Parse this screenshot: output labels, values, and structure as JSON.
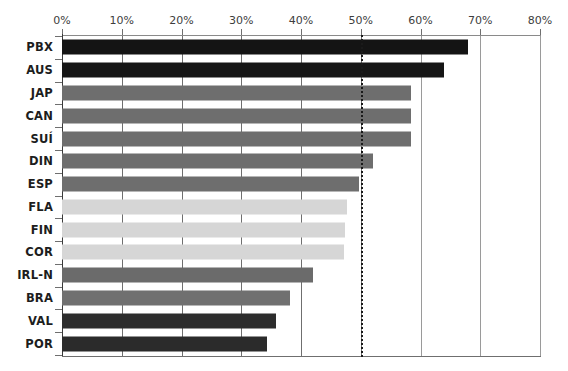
{
  "chart_data": {
    "type": "bar",
    "orientation": "horizontal",
    "title": "",
    "subtitle": "",
    "xlabel": "",
    "ylabel": "",
    "xlim": [
      0,
      80
    ],
    "xtick_values": [
      0,
      10,
      20,
      30,
      40,
      50,
      60,
      70,
      80
    ],
    "xtick_labels": [
      "0%",
      "10%",
      "20%",
      "30%",
      "40%",
      "50%",
      "60%",
      "70%",
      "80%"
    ],
    "xaxis_position": "top",
    "grid": "vertical",
    "legend": "none",
    "reference_line": {
      "value": 50,
      "label": "50%",
      "style": "dotted",
      "color": "#1a1a1a"
    },
    "categories": [
      "PBX",
      "AUS",
      "JAP",
      "CAN",
      "SUÍ",
      "DIN",
      "ESP",
      "FLA",
      "FIN",
      "COR",
      "IRL-N",
      "BRA",
      "VAL",
      "POR"
    ],
    "values": [
      68.0,
      64.0,
      58.4,
      58.4,
      58.4,
      52.0,
      49.7,
      47.7,
      47.4,
      47.2,
      42.0,
      38.2,
      35.8,
      34.3
    ],
    "bar_colors": [
      "#141414",
      "#161616",
      "#6e6e6e",
      "#6e6e6e",
      "#6e6e6e",
      "#6e6e6e",
      "#6e6e6e",
      "#d6d6d6",
      "#d6d6d6",
      "#d6d6d6",
      "#6b6b6b",
      "#707070",
      "#2d2d2d",
      "#2b2b2b"
    ],
    "series": [
      {
        "name": "percentage",
        "values": [
          68.0,
          64.0,
          58.4,
          58.4,
          58.4,
          52.0,
          49.7,
          47.7,
          47.4,
          47.2,
          42.0,
          38.2,
          35.8,
          34.3
        ]
      }
    ]
  },
  "colors": {
    "background": "#ffffff",
    "axis": "#6f6f6f",
    "gridline": "#6f6f6f",
    "text": "#1d1d1d",
    "tick_text": "#3d3d3d",
    "bar_dark": "#141414",
    "bar_dark_alt": "#2d2d2d",
    "bar_medium": "#6e6e6e",
    "bar_light": "#d6d6d6",
    "reference_line": "#1a1a1a"
  }
}
